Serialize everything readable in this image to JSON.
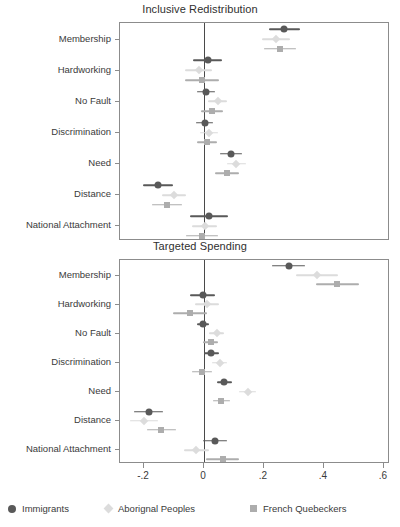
{
  "chart_data": {
    "type": "scatter",
    "subtype": "coefficient-forest-plot",
    "title": "",
    "xlabel": "",
    "ylabel": "",
    "xlim": [
      -0.28,
      0.62
    ],
    "xticks": [
      -0.2,
      0,
      0.2,
      0.4,
      0.6
    ],
    "xtick_labels": [
      "-.2",
      "0",
      ".2",
      ".4",
      ".6"
    ],
    "grid": false,
    "reference_line": 0,
    "legend_position": "bottom",
    "categories": [
      "Membership",
      "Hardworking",
      "No Fault",
      "Discrimination",
      "Need",
      "Distance",
      "National Attachment"
    ],
    "series_names": [
      "Immigrants",
      "Aborignal Peoples",
      "French Quebeckers"
    ],
    "series_markers": [
      "circle",
      "diamond",
      "square"
    ],
    "series_colors": [
      "#595959",
      "#dcdcdc",
      "#adadad"
    ],
    "panels": [
      {
        "title": "Inclusive Redistribution",
        "series": [
          {
            "name": "Immigrants",
            "marker": "circle",
            "color": "#595959",
            "values": [
              0.268,
              0.012,
              0.007,
              0.002,
              0.089,
              -0.155,
              0.016
            ],
            "ci_low": [
              0.215,
              -0.037,
              -0.022,
              -0.026,
              0.052,
              -0.205,
              -0.048
            ],
            "ci_high": [
              0.32,
              0.06,
              0.036,
              0.03,
              0.126,
              -0.105,
              0.08
            ]
          },
          {
            "name": "Aborignal Peoples",
            "marker": "diamond",
            "color": "#dcdcdc",
            "values": [
              0.24,
              -0.018,
              0.045,
              0.016,
              0.108,
              -0.1,
              0.002
            ],
            "ci_low": [
              0.193,
              -0.065,
              0.012,
              -0.014,
              0.075,
              -0.14,
              -0.04
            ],
            "ci_high": [
              0.288,
              0.028,
              0.078,
              0.046,
              0.141,
              -0.06,
              0.044
            ]
          },
          {
            "name": "French Quebeckers",
            "marker": "square",
            "color": "#adadad",
            "values": [
              0.252,
              -0.006,
              0.026,
              0.009,
              0.075,
              -0.122,
              -0.006
            ],
            "ci_low": [
              0.2,
              -0.062,
              -0.01,
              -0.024,
              0.035,
              -0.172,
              -0.06
            ],
            "ci_high": [
              0.305,
              0.05,
              0.062,
              0.042,
              0.115,
              -0.072,
              0.048
            ]
          }
        ]
      },
      {
        "title": "Targeted Spending",
        "series": [
          {
            "name": "Immigrants",
            "marker": "circle",
            "color": "#595959",
            "values": [
              0.282,
              -0.005,
              -0.002,
              0.024,
              0.068,
              -0.185,
              0.038
            ],
            "ci_low": [
              0.228,
              -0.046,
              -0.022,
              -0.001,
              0.042,
              -0.232,
              -0.002
            ],
            "ci_high": [
              0.337,
              0.038,
              0.018,
              0.05,
              0.094,
              -0.138,
              0.078
            ]
          },
          {
            "name": "Aborignal Peoples",
            "marker": "diamond",
            "color": "#dcdcdc",
            "values": [
              0.376,
              0.01,
              0.042,
              0.053,
              0.145,
              -0.2,
              -0.026
            ],
            "ci_low": [
              0.305,
              -0.03,
              0.016,
              0.028,
              0.118,
              -0.248,
              -0.068
            ],
            "ci_high": [
              0.448,
              0.05,
              0.068,
              0.078,
              0.172,
              -0.152,
              0.018
            ]
          },
          {
            "name": "French Quebeckers",
            "marker": "square",
            "color": "#adadad",
            "values": [
              0.444,
              -0.046,
              0.022,
              -0.006,
              0.058,
              -0.142,
              0.062
            ],
            "ci_low": [
              0.372,
              -0.102,
              -0.002,
              -0.04,
              0.03,
              -0.19,
              0.008
            ],
            "ci_high": [
              0.518,
              0.01,
              0.048,
              0.028,
              0.086,
              -0.092,
              0.118
            ]
          }
        ]
      }
    ],
    "legend": [
      {
        "label": "Immigrants",
        "marker": "circle",
        "color": "#595959"
      },
      {
        "label": "Aborignal Peoples",
        "marker": "diamond",
        "color": "#dcdcdc"
      },
      {
        "label": "French Quebeckers",
        "marker": "square",
        "color": "#adadad"
      }
    ]
  },
  "layout": {
    "panel_top": {
      "title_y": 3,
      "plot_x": 119,
      "plot_y": 22,
      "plot_w": 270,
      "plot_h": 218
    },
    "panel_bottom": {
      "title_y": 240,
      "plot_x": 119,
      "plot_y": 259,
      "plot_w": 270,
      "plot_h": 204
    },
    "axis_label_y": 470,
    "legend_y": 503
  }
}
